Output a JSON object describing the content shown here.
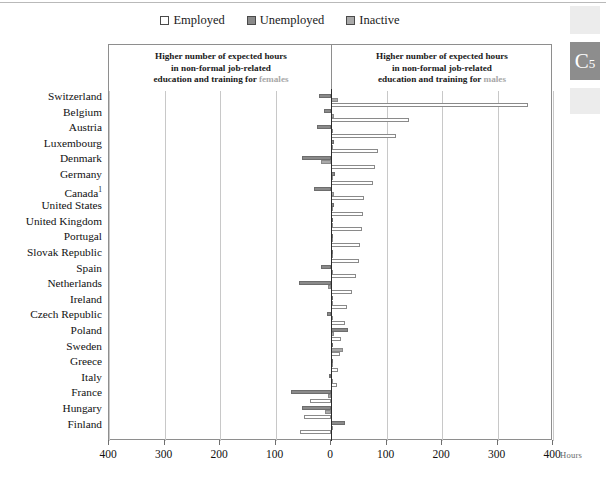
{
  "page_marker": {
    "label": "C",
    "subscript": "5"
  },
  "legend": {
    "items": [
      {
        "label": "Employed",
        "swatch_name": "legend-swatch-employed",
        "color": "#ffffff"
      },
      {
        "label": "Unemployed",
        "swatch_name": "legend-swatch-unemployed",
        "color": "#8a8a8a"
      },
      {
        "label": "Inactive",
        "swatch_name": "legend-swatch-inactive",
        "color": "#a9a9a9"
      }
    ]
  },
  "annotations": {
    "left": {
      "line1": "Higher number of expected hours",
      "line2": "in non-formal job-related",
      "line3_prefix": "education and training for ",
      "line3_accent": "females"
    },
    "right": {
      "line1": "Higher number of expected hours",
      "line2": "in non-formal job-related",
      "line3_prefix": "education and training for ",
      "line3_accent": "males"
    }
  },
  "axis": {
    "unit_label": "Hours",
    "tick_labels": [
      "400",
      "300",
      "200",
      "100",
      "0",
      "100",
      "200",
      "300",
      "400"
    ],
    "tick_values": [
      -400,
      -300,
      -200,
      -100,
      0,
      100,
      200,
      300,
      400
    ],
    "xlim": [
      -400,
      400
    ]
  },
  "chart_data": {
    "type": "bar",
    "orientation": "horizontal",
    "title": "",
    "subtitle": "",
    "xlabel": "Hours",
    "ylabel": "",
    "xlim": [
      -400,
      400
    ],
    "grid": true,
    "legend_position": "top-center",
    "note": "Diverging bar chart: positive values mean higher expected hours for males, negative values mean higher expected hours for females.",
    "categories": [
      "Switzerland",
      "Belgium",
      "Austria",
      "Luxembourg",
      "Denmark",
      "Germany",
      "Canada",
      "United States",
      "United Kingdom",
      "Portugal",
      "Slovak Republic",
      "Spain",
      "Netherlands",
      "Ireland",
      "Czech Republic",
      "Poland",
      "Sweden",
      "Greece",
      "Italy",
      "France",
      "Hungary",
      "Finland"
    ],
    "category_footnotes": {
      "Canada": "1"
    },
    "series": [
      {
        "name": "Employed",
        "color": "#ffffff",
        "values": [
          355,
          140,
          118,
          85,
          80,
          75,
          60,
          57,
          55,
          52,
          50,
          45,
          38,
          28,
          25,
          18,
          16,
          12,
          10,
          -38,
          -48,
          -55
        ]
      },
      {
        "name": "Unemployed",
        "color": "#8a8a8a",
        "values": [
          -22,
          -12,
          -25,
          6,
          -52,
          8,
          -30,
          5,
          4,
          3,
          3,
          -18,
          -58,
          2,
          -8,
          30,
          2,
          1,
          -4,
          -72,
          -52,
          26
        ]
      },
      {
        "name": "Inactive",
        "color": "#a9a9a9",
        "values": [
          12,
          5,
          4,
          3,
          -18,
          4,
          6,
          3,
          2,
          2,
          2,
          3,
          -5,
          2,
          2,
          5,
          22,
          3,
          2,
          -6,
          -10,
          4
        ]
      }
    ]
  }
}
